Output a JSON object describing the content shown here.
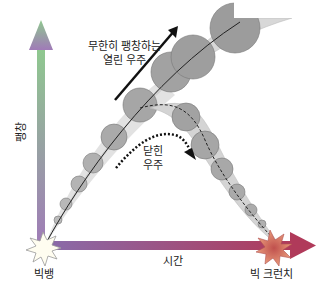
{
  "labels": {
    "open_universe_line1": "무한히 팽창하는",
    "open_universe_line2": "열린 우주",
    "closed_universe_line1": "닫힌",
    "closed_universe_line2": "우주",
    "y_axis": "팽창",
    "x_axis": "시간",
    "big_bang": "빅뱅",
    "big_crunch": "빅 크런치"
  },
  "colors": {
    "y_axis_top": "#8fc98f",
    "y_axis_bottom": "#a07ab8",
    "x_axis_left": "#8a6aa8",
    "x_axis_right": "#b03a5a",
    "band_fill": "#d8d8d8",
    "circle_fill": "#a8a8a8",
    "big_crunch_core": "#c0504d"
  }
}
